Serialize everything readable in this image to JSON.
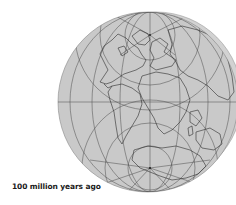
{
  "map": {
    "title": "Paleogeographic globe",
    "caption": "100 million years ago",
    "projection": "orthographic",
    "colors": {
      "background": "#ffffff",
      "globe_fill": "#c9c9c9",
      "globe_overlap_fill": "#d2d2d2",
      "graticule": "#4a4a4a",
      "coastline": "#2e2e2e",
      "caption": "#1a1a1a"
    },
    "features": [
      "north-pole-graticule-center",
      "south-pole-graticule-center",
      "equator-line",
      "central-meridian",
      "north-america",
      "south-america",
      "africa",
      "europe",
      "asia",
      "india",
      "antarctica",
      "australia"
    ]
  }
}
